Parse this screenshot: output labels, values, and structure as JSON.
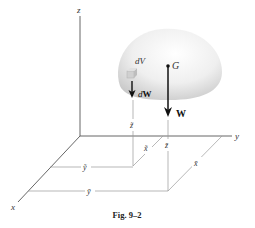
{
  "figure": {
    "caption": "Fig. 9–2",
    "colors": {
      "axis": "#555555",
      "guide": "#9a9a9a",
      "arrow": "#111111",
      "body_light": "#f4f4f4",
      "body_dark": "#c8c8c8",
      "element": "#d2d2d2"
    },
    "axes": {
      "z_label": "z",
      "y_label": "y",
      "x_label": "x"
    },
    "body": {
      "centroid_label": "G",
      "element_label": "dV",
      "element_weight_label": "dW",
      "total_weight_label": "W"
    },
    "dimensions": {
      "element": {
        "x_label": "x̃",
        "y_label": "ỹ",
        "z_label": "z̃"
      },
      "centroid": {
        "x_label": "x̄",
        "y_label": "ȳ",
        "z_label": "z̄"
      }
    }
  }
}
